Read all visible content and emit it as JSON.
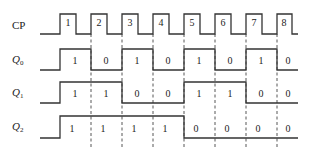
{
  "diagram": {
    "type": "timing-diagram",
    "title": "",
    "signals": [
      {
        "name": "CP",
        "label": "CP",
        "subscript": "",
        "kind": "clock",
        "pulse_labels": [
          "1",
          "2",
          "3",
          "4",
          "5",
          "6",
          "7",
          "8"
        ]
      },
      {
        "name": "Q0",
        "label": "Q",
        "subscript": "0",
        "kind": "level",
        "values": [
          "1",
          "0",
          "1",
          "0",
          "1",
          "0",
          "1",
          "0"
        ]
      },
      {
        "name": "Q1",
        "label": "Q",
        "subscript": "1",
        "kind": "level",
        "values": [
          "1",
          "1",
          "0",
          "0",
          "1",
          "1",
          "0",
          "0"
        ]
      },
      {
        "name": "Q2",
        "label": "Q",
        "subscript": "2",
        "kind": "level",
        "values": [
          "1",
          "1",
          "1",
          "1",
          "0",
          "0",
          "0",
          "0"
        ]
      }
    ],
    "trigger": "falling-edge",
    "dashed_lines_at_clock_falling_edges": 7
  }
}
